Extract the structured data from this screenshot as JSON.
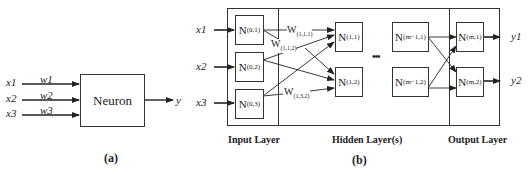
{
  "panel_a": {
    "caption": "(a)",
    "neuron_label": "Neuron",
    "inputs": [
      {
        "x": "x1",
        "w": "w1"
      },
      {
        "x": "x2",
        "w": "w2"
      },
      {
        "x": "x3",
        "w": "w3"
      }
    ],
    "output": "y"
  },
  "panel_b": {
    "caption": "(b)",
    "inputs": [
      "x1",
      "x2",
      "x3"
    ],
    "outputs": [
      "y1",
      "y2"
    ],
    "layers": {
      "input": "Input Layer",
      "hidden": "Hidden Layer(s)",
      "output": "Output Layer"
    },
    "nodes": {
      "n01": {
        "base": "N",
        "sub": "(0,1)"
      },
      "n02": {
        "base": "N",
        "sub": "(0,2)"
      },
      "n03": {
        "base": "N",
        "sub": "(0,3)"
      },
      "n11": {
        "base": "N",
        "sub": "(1,1)"
      },
      "n12": {
        "base": "N",
        "sub": "(1,2)"
      },
      "nm11": {
        "base": "N",
        "sub": "(m−1,1)"
      },
      "nm12": {
        "base": "N",
        "sub": "(m−1,2)"
      },
      "nm1": {
        "base": "N",
        "sub": "(m,1)"
      },
      "nm2": {
        "base": "N",
        "sub": "(m,2)"
      }
    },
    "weights": {
      "w111": {
        "base": "W",
        "sub": "(1,1,1)"
      },
      "w112": {
        "base": "W",
        "sub": "(1,1,2)"
      },
      "w132": {
        "base": "W",
        "sub": "(1,3,2)"
      }
    },
    "ellipsis": "•••"
  }
}
